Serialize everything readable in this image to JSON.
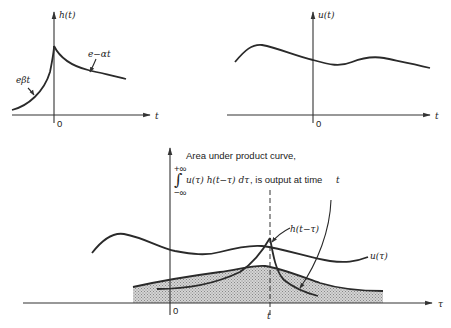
{
  "diagram": {
    "panels": [
      {
        "id": "impulse-response",
        "y_label": "h(t)",
        "x_label": "t",
        "origin_label": "0",
        "annotations": [
          "e^{βt}",
          "e^{-αt}"
        ]
      },
      {
        "id": "input-signal",
        "y_label": "u(t)",
        "x_label": "t",
        "origin_label": "0"
      },
      {
        "id": "product-curve",
        "x_label": "τ",
        "origin_label": "0",
        "t_marker_label": "t",
        "curve_labels": [
          "h(t−τ)",
          "u(τ)"
        ],
        "caption_line1": "Area under product curve,",
        "caption_integral_upper": "+∞",
        "caption_integral_lower": "−∞",
        "caption_integrand": "u(τ) h(t−τ) dτ",
        "caption_suffix": ", is output at  time ",
        "caption_time": "t"
      }
    ]
  },
  "labels": {
    "h_t": "h(t)",
    "u_t": "u(t)",
    "t": "t",
    "zero": "0",
    "e_beta": "eβt",
    "e_alpha": "e−αt",
    "tau": "τ",
    "h_t_minus_tau": "h(t−τ)",
    "u_tau": "u(τ)",
    "caption_line1": "Area under product curve,",
    "plus_inf": "+∞",
    "minus_inf": "−∞",
    "integral_sign": "∫",
    "integrand": "u(τ) h(t−τ) dτ",
    "caption_suffix": ", is output at  time",
    "caption_time": "t"
  },
  "colors": {
    "ink": "#2a2a2a",
    "shade": "#c8c8c8",
    "background": "#ffffff"
  }
}
